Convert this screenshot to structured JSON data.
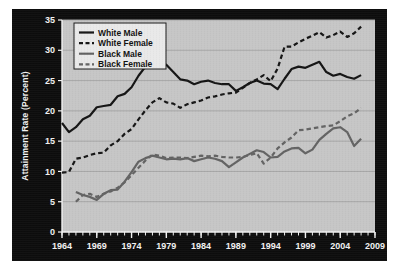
{
  "figure": {
    "background_color": "#0d0d0d",
    "plot_background_color": "#c6c6c6",
    "grid_color": "#a6a6a6",
    "axis_text_color": "#f2f2f2"
  },
  "chart_data": {
    "type": "line",
    "title": "",
    "xlabel": "",
    "ylabel": "Attainment Rate (Percent)",
    "xlim": [
      1964,
      2009
    ],
    "ylim": [
      0,
      35
    ],
    "ytick_step": 5,
    "xtick_step": 5,
    "xminor_tick_step": 1,
    "grid": "horizontal",
    "legend_position": "top-left",
    "ytick_labels": [
      "0",
      "5",
      "10",
      "15",
      "20",
      "25",
      "30",
      "35"
    ],
    "ytick_values": [
      0,
      5,
      10,
      15,
      20,
      25,
      30,
      35
    ],
    "xtick_labels": [
      "1964",
      "1969",
      "1974",
      "1979",
      "1984",
      "1989",
      "1994",
      "1999",
      "2004",
      "2009"
    ],
    "xtick_values": [
      1964,
      1969,
      1974,
      1979,
      1984,
      1989,
      1994,
      1999,
      2004,
      2009
    ],
    "series": [
      {
        "name": "White Male",
        "color": "#141414",
        "style": "solid",
        "width": 2.2,
        "x": [
          1964,
          1965,
          1966,
          1967,
          1968,
          1969,
          1970,
          1971,
          1972,
          1973,
          1974,
          1975,
          1976,
          1977,
          1978,
          1979,
          1980,
          1981,
          1982,
          1983,
          1984,
          1985,
          1986,
          1987,
          1988,
          1989,
          1990,
          1991,
          1992,
          1993,
          1994,
          1995,
          1996,
          1997,
          1998,
          1999,
          2000,
          2001,
          2002,
          2003,
          2004,
          2005,
          2006,
          2007
        ],
        "values": [
          18.0,
          16.5,
          17.3,
          18.6,
          19.2,
          20.6,
          20.8,
          21.0,
          22.4,
          22.8,
          23.9,
          25.8,
          27.3,
          28.7,
          28.4,
          27.6,
          26.4,
          25.2,
          25.0,
          24.4,
          24.8,
          25.0,
          24.6,
          24.4,
          24.4,
          23.3,
          23.9,
          24.6,
          25.0,
          24.5,
          24.4,
          23.6,
          25.3,
          26.9,
          27.3,
          27.1,
          27.6,
          28.1,
          26.4,
          25.8,
          26.1,
          25.6,
          25.3,
          25.9
        ]
      },
      {
        "name": "White Female",
        "color": "#141414",
        "style": "dashed",
        "width": 2.2,
        "x": [
          1964,
          1965,
          1966,
          1967,
          1968,
          1969,
          1970,
          1971,
          1972,
          1973,
          1974,
          1975,
          1976,
          1977,
          1978,
          1979,
          1980,
          1981,
          1982,
          1983,
          1984,
          1985,
          1986,
          1987,
          1988,
          1989,
          1990,
          1991,
          1992,
          1993,
          1994,
          1995,
          1996,
          1997,
          1998,
          1999,
          2000,
          2001,
          2002,
          2003,
          2004,
          2005,
          2006,
          2007
        ],
        "values": [
          9.8,
          9.9,
          12.1,
          12.3,
          12.7,
          13.0,
          13.1,
          14.3,
          15.0,
          16.2,
          17.0,
          18.6,
          20.1,
          21.4,
          22.1,
          21.4,
          21.2,
          20.5,
          21.1,
          21.4,
          21.7,
          22.2,
          22.4,
          22.7,
          22.9,
          23.0,
          23.8,
          24.6,
          25.2,
          25.9,
          24.9,
          27.0,
          30.6,
          30.6,
          31.3,
          31.9,
          32.4,
          33.0,
          32.1,
          32.5,
          33.1,
          32.2,
          32.8,
          33.9
        ]
      },
      {
        "name": "Black Male",
        "color": "#636363",
        "style": "solid",
        "width": 2.2,
        "x": [
          1966,
          1967,
          1968,
          1969,
          1970,
          1971,
          1972,
          1973,
          1974,
          1975,
          1976,
          1977,
          1978,
          1979,
          1980,
          1981,
          1982,
          1983,
          1984,
          1985,
          1986,
          1987,
          1988,
          1989,
          1990,
          1991,
          1992,
          1993,
          1994,
          1995,
          1996,
          1997,
          1998,
          1999,
          2000,
          2001,
          2002,
          2003,
          2004,
          2005,
          2006,
          2007
        ],
        "values": [
          6.6,
          6.1,
          5.8,
          5.3,
          6.3,
          6.9,
          7.0,
          8.3,
          9.9,
          11.6,
          12.2,
          12.6,
          12.3,
          12.0,
          12.1,
          12.0,
          12.2,
          11.7,
          12.0,
          12.3,
          12.1,
          11.7,
          10.7,
          11.5,
          12.3,
          12.9,
          13.5,
          13.2,
          12.3,
          12.4,
          13.3,
          13.8,
          13.9,
          13.0,
          13.6,
          15.2,
          16.2,
          17.1,
          17.3,
          16.5,
          14.2,
          15.4
        ]
      },
      {
        "name": "Black Female",
        "color": "#636363",
        "style": "dashed",
        "width": 2.2,
        "x": [
          1966,
          1967,
          1968,
          1969,
          1970,
          1971,
          1972,
          1973,
          1974,
          1975,
          1976,
          1977,
          1978,
          1979,
          1980,
          1981,
          1982,
          1983,
          1984,
          1985,
          1986,
          1987,
          1988,
          1989,
          1990,
          1991,
          1992,
          1993,
          1994,
          1995,
          1996,
          1997,
          1998,
          1999,
          2000,
          2001,
          2002,
          2003,
          2004,
          2005,
          2006,
          2007
        ],
        "values": [
          5.0,
          6.1,
          6.3,
          5.8,
          6.3,
          6.7,
          7.3,
          8.2,
          9.4,
          10.6,
          11.8,
          12.8,
          12.6,
          12.2,
          12.3,
          12.3,
          12.2,
          12.4,
          12.6,
          12.5,
          12.6,
          12.4,
          12.3,
          12.3,
          12.4,
          12.7,
          13.0,
          11.3,
          12.3,
          13.8,
          14.8,
          15.6,
          16.8,
          16.9,
          17.1,
          17.3,
          17.5,
          17.6,
          18.3,
          19.1,
          19.6,
          20.5
        ]
      }
    ]
  },
  "legend": {
    "items": [
      {
        "label": "White Male",
        "color": "#141414",
        "style": "solid"
      },
      {
        "label": "White Female",
        "color": "#141414",
        "style": "dashed"
      },
      {
        "label": "Black Male",
        "color": "#636363",
        "style": "solid"
      },
      {
        "label": "Black Female",
        "color": "#636363",
        "style": "dashed"
      }
    ]
  }
}
